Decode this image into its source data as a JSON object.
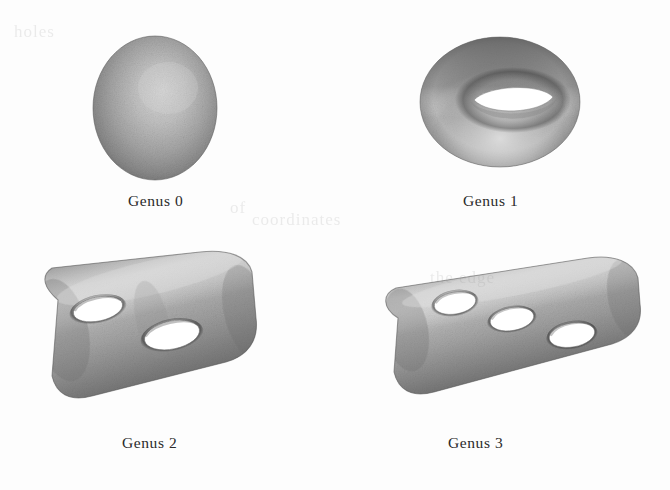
{
  "figure": {
    "background_color": "#fdfdfd",
    "ink_color": "#2a2a2a",
    "surface_dark": "#6b6b6b",
    "surface_mid": "#9c9c9c",
    "surface_light": "#d8d8d8",
    "hole_color": "#ffffff",
    "panels": [
      {
        "id": "genus-0",
        "label": "Genus 0",
        "shape": "sphere",
        "holes": 0
      },
      {
        "id": "genus-1",
        "label": "Genus 1",
        "shape": "torus",
        "holes": 1
      },
      {
        "id": "genus-2",
        "label": "Genus 2",
        "shape": "two-holed-slab",
        "holes": 2
      },
      {
        "id": "genus-3",
        "label": "Genus 3",
        "shape": "three-holed-slab",
        "holes": 3
      }
    ]
  },
  "ghost_text": {
    "line_1": "holes",
    "line_2": "of",
    "line_3": "the edge",
    "line_4": "coordinates"
  }
}
